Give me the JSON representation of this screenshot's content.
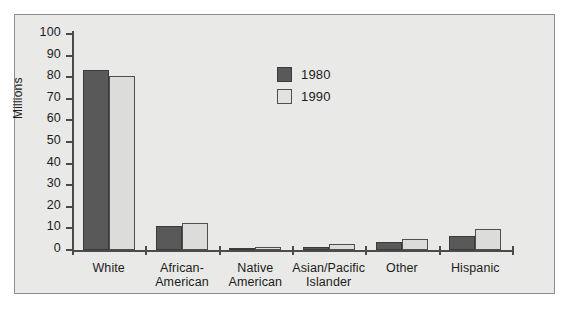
{
  "chart_data": {
    "type": "bar",
    "title": "",
    "subtitle": "",
    "xlabel": "",
    "ylabel": "Millions",
    "ylim": [
      0,
      100
    ],
    "ytick_labels": [
      "100",
      "90",
      "80",
      "70",
      "60",
      "50",
      "40",
      "30",
      "20",
      "10",
      "0"
    ],
    "ytick_values": [
      100,
      90,
      80,
      70,
      60,
      50,
      40,
      30,
      20,
      10,
      0
    ],
    "grid": false,
    "legend_position": "upper-center",
    "categories": [
      "White",
      "African-American",
      "Native American",
      "Asian/Pacific Islander",
      "Other",
      "Hispanic"
    ],
    "category_label_lines": [
      [
        "White"
      ],
      [
        "African-",
        "American"
      ],
      [
        "Native",
        "American"
      ],
      [
        "Asian/Pacific",
        "Islander"
      ],
      [
        "Other"
      ],
      [
        "Hispanic"
      ]
    ],
    "series": [
      {
        "name": "1980",
        "color": "#59595a",
        "values": [
          83.5,
          11.0,
          1.0,
          1.5,
          3.5,
          6.5
        ]
      },
      {
        "name": "1990",
        "color": "#dcdcda",
        "values": [
          80.5,
          12.5,
          1.5,
          3.0,
          5.0,
          9.5
        ]
      }
    ]
  },
  "legend": {
    "entries": [
      {
        "label": "1980",
        "swatch": "dark-gray-swatch"
      },
      {
        "label": "1990",
        "swatch": "light-gray-swatch"
      }
    ]
  },
  "axes": {
    "y_title": "Millions"
  }
}
